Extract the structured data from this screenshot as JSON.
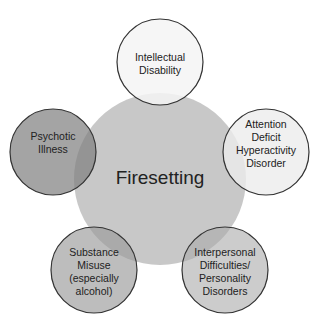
{
  "diagram": {
    "center": {
      "label": "Firesetting",
      "fill": "#c8c8c8"
    },
    "factors": [
      {
        "id": "intellectual-disability",
        "lines": [
          "Intellectual",
          "Disability"
        ],
        "fill": "#f4f4f4"
      },
      {
        "id": "adhd",
        "lines": [
          "Attention",
          "Deficit",
          "Hyperactivity",
          "Disorder"
        ],
        "fill": "#e8e8e8"
      },
      {
        "id": "interpersonal",
        "lines": [
          "Interpersonal",
          "Difficulties/",
          "Personality",
          "Disorders"
        ],
        "fill": "#b8b8b8"
      },
      {
        "id": "substance-misuse",
        "lines": [
          "Substance",
          "Misuse",
          "(especially",
          "alcohol)"
        ],
        "fill": "#a8a8a8"
      },
      {
        "id": "psychotic-illness",
        "lines": [
          "Psychotic",
          "Illness"
        ],
        "fill": "#949494"
      }
    ]
  }
}
